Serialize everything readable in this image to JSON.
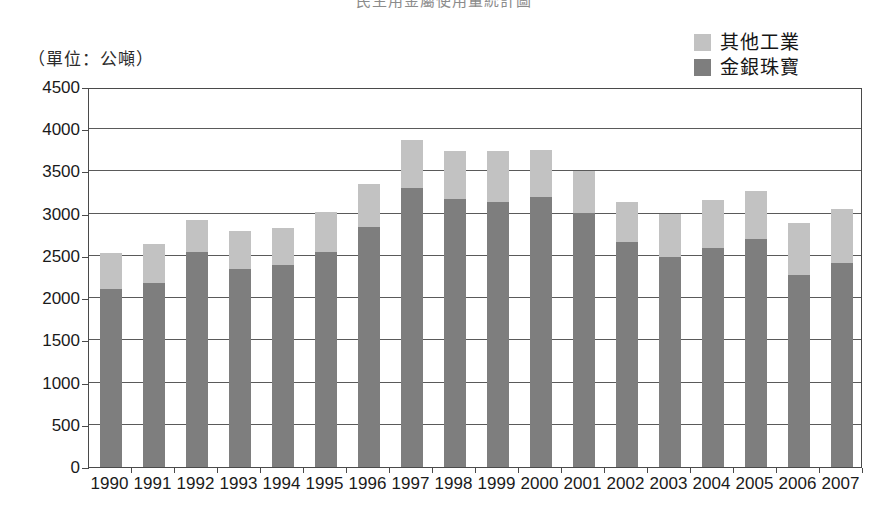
{
  "title": "民生用金屬使用量統計圖",
  "unit_caption": "（單位：公噸）",
  "legend": {
    "items": [
      {
        "label": "其他工業",
        "color": "#c2c2c2"
      },
      {
        "label": "金銀珠寶",
        "color": "#7e7e7e"
      }
    ]
  },
  "axis": {
    "y_ticks": [
      "4500",
      "4000",
      "3500",
      "3000",
      "2500",
      "2000",
      "1500",
      "1000",
      "500",
      "0"
    ],
    "x_ticks": [
      "1990",
      "1991",
      "1992",
      "1993",
      "1994",
      "1995",
      "1996",
      "1997",
      "1998",
      "1999",
      "2000",
      "2001",
      "2002",
      "2003",
      "2004",
      "2005",
      "2006",
      "2007"
    ]
  },
  "chart_data": {
    "type": "bar",
    "stacked": true,
    "title": "民生用金屬使用量統計圖",
    "xlabel": "",
    "ylabel": "（單位：公噸）",
    "ylim": [
      0,
      4500
    ],
    "ytick_step": 500,
    "grid": true,
    "legend_position": "top-right",
    "categories": [
      "1990",
      "1991",
      "1992",
      "1993",
      "1994",
      "1995",
      "1996",
      "1997",
      "1998",
      "1999",
      "2000",
      "2001",
      "2002",
      "2003",
      "2004",
      "2005",
      "2006",
      "2007"
    ],
    "series": [
      {
        "name": "金銀珠寶",
        "color": "#7e7e7e",
        "values": [
          2110,
          2180,
          2545,
          2350,
          2390,
          2545,
          2840,
          3300,
          3170,
          3140,
          3200,
          3010,
          2660,
          2490,
          2590,
          2700,
          2270,
          2420
        ]
      },
      {
        "name": "其他工業",
        "color": "#c2c2c2",
        "values": [
          430,
          460,
          375,
          450,
          440,
          475,
          510,
          570,
          570,
          600,
          560,
          490,
          480,
          510,
          570,
          570,
          620,
          630
        ]
      }
    ],
    "totals": [
      2540,
      2640,
      2920,
      2800,
      2830,
      3020,
      3350,
      3870,
      3740,
      3740,
      3760,
      3500,
      3140,
      3000,
      3160,
      3270,
      2890,
      3050
    ]
  }
}
